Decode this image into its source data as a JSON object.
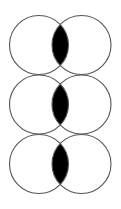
{
  "diagram": {
    "type": "venn-intersection-stack",
    "width": 121,
    "height": 209,
    "colors": {
      "background": "#ffffff",
      "stroke": "#555555",
      "fill": "#000000"
    },
    "circle_radius": 29.5,
    "left_center_x": 39,
    "right_center_x": 81.5,
    "rows": [
      {
        "center_y": 45
      },
      {
        "center_y": 104.5
      },
      {
        "center_y": 164
      }
    ]
  }
}
